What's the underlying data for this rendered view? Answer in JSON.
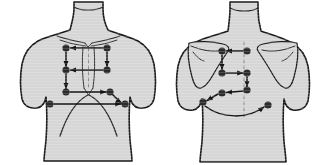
{
  "figure": {
    "background_color": "#ffffff",
    "body_fill_color": "#d6d6d6",
    "body_outline_color": "#1a1a1a",
    "dot_color": "#2b2b2b",
    "arrow_color": "#141414",
    "midline_color": "#8d8d8d",
    "dot_radius": 3.6,
    "panel_count": 2
  },
  "panels": [
    {
      "id": "anterior",
      "name": "anterior-chest-view",
      "view_label": "Anterior",
      "origin_x": 0,
      "landmarks": {
        "neck": "neck-outline",
        "clavicles": "clavicle-lines",
        "sternum": "sternum-outline",
        "costal_margin": "costal-margin-lines"
      },
      "sites": [
        {
          "name": "site-a1",
          "x": 66,
          "y": 48
        },
        {
          "name": "site-a2",
          "x": 107,
          "y": 48
        },
        {
          "name": "site-a3",
          "x": 66,
          "y": 70
        },
        {
          "name": "site-a4",
          "x": 107,
          "y": 70
        },
        {
          "name": "site-a5",
          "x": 66,
          "y": 92
        },
        {
          "name": "site-a6",
          "x": 110,
          "y": 92
        },
        {
          "name": "site-a7",
          "x": 50,
          "y": 104
        },
        {
          "name": "site-a8",
          "x": 125,
          "y": 104
        }
      ],
      "arrows": [
        {
          "name": "arrow-a1-to-a2",
          "kind": "horizontal",
          "from": "site-a2",
          "to": "site-a1"
        },
        {
          "name": "arrow-a2-to-a4",
          "kind": "vertical",
          "from": "site-a2",
          "to": "site-a4"
        },
        {
          "name": "arrow-a4-to-a3",
          "kind": "horizontal",
          "from": "site-a4",
          "to": "site-a3"
        },
        {
          "name": "arrow-a1-to-a3",
          "kind": "vertical",
          "from": "site-a1",
          "to": "site-a3"
        },
        {
          "name": "arrow-a3-to-a5",
          "kind": "vertical",
          "from": "site-a3",
          "to": "site-a5"
        },
        {
          "name": "arrow-a5-to-a6",
          "kind": "horizontal",
          "from": "site-a5",
          "to": "site-a6"
        },
        {
          "name": "arrow-a6-to-a8",
          "kind": "curved",
          "from": "site-a6",
          "to": "site-a8"
        },
        {
          "name": "arrow-a7-to-a8",
          "kind": "horizontal",
          "from": "site-a7",
          "to": "site-a8"
        }
      ]
    },
    {
      "id": "posterior",
      "name": "posterior-chest-view",
      "view_label": "Posterior",
      "origin_x": 158,
      "landmarks": {
        "neck": "neck-outline",
        "left_scapula": "scapula-outline-left",
        "right_scapula": "scapula-outline-right",
        "spine": "spine-midline"
      },
      "sites": [
        {
          "name": "site-p1",
          "x": 222,
          "y": 51
        },
        {
          "name": "site-p2",
          "x": 247,
          "y": 51
        },
        {
          "name": "site-p3",
          "x": 222,
          "y": 73
        },
        {
          "name": "site-p4",
          "x": 247,
          "y": 73
        },
        {
          "name": "site-p5",
          "x": 222,
          "y": 93
        },
        {
          "name": "site-p6",
          "x": 247,
          "y": 90
        },
        {
          "name": "site-p7",
          "x": 203,
          "y": 102
        },
        {
          "name": "site-p8",
          "x": 268,
          "y": 105
        }
      ],
      "arrows": [
        {
          "name": "arrow-p2-to-p1",
          "kind": "horizontal",
          "from": "site-p2",
          "to": "site-p1"
        },
        {
          "name": "arrow-p1-to-p3",
          "kind": "vertical",
          "from": "site-p1",
          "to": "site-p3"
        },
        {
          "name": "arrow-p3-to-p4",
          "kind": "horizontal",
          "from": "site-p3",
          "to": "site-p4"
        },
        {
          "name": "arrow-p4-to-p6",
          "kind": "vertical",
          "from": "site-p4",
          "to": "site-p6"
        },
        {
          "name": "arrow-p6-to-p5",
          "kind": "horizontal",
          "from": "site-p6",
          "to": "site-p5"
        },
        {
          "name": "arrow-p5-to-p7",
          "kind": "diagonal",
          "from": "site-p5",
          "to": "site-p7"
        },
        {
          "name": "arrow-p7-to-p8",
          "kind": "curved",
          "from": "site-p7",
          "to": "site-p8"
        }
      ]
    }
  ]
}
